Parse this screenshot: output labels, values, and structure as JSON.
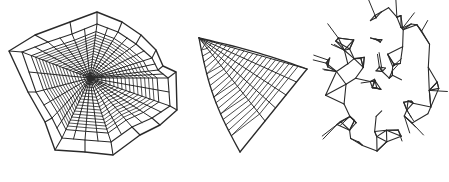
{
  "figure": {
    "alt": "Three spider web types: orb web, triangle web, and tangled cobweb",
    "width": 449,
    "height": 182,
    "background": "#ffffff",
    "stroke_color": "#2a2a2a"
  },
  "webs": [
    {
      "name": "orb-web",
      "label": "Orb web",
      "hub": [
        90,
        78
      ],
      "frame": [
        [
          9,
          51
        ],
        [
          35,
          35
        ],
        [
          70,
          22
        ],
        [
          97,
          12
        ],
        [
          122,
          22
        ],
        [
          141,
          35
        ],
        [
          156,
          50
        ],
        [
          163,
          66
        ],
        [
          176,
          72
        ],
        [
          177,
          110
        ],
        [
          160,
          125
        ],
        [
          140,
          135
        ],
        [
          113,
          155
        ],
        [
          85,
          152
        ],
        [
          55,
          150
        ],
        [
          45,
          122
        ],
        [
          28,
          92
        ]
      ],
      "inner_frame": [
        [
          22,
          52
        ],
        [
          48,
          42
        ],
        [
          72,
          34
        ],
        [
          97,
          24
        ],
        [
          118,
          32
        ],
        [
          136,
          44
        ],
        [
          152,
          58
        ],
        [
          158,
          70
        ],
        [
          168,
          78
        ],
        [
          170,
          106
        ],
        [
          152,
          118
        ],
        [
          132,
          127
        ],
        [
          111,
          142
        ],
        [
          85,
          140
        ],
        [
          62,
          138
        ],
        [
          52,
          118
        ],
        [
          36,
          92
        ]
      ],
      "spiral_turns": 16,
      "spiral_r_min": 4,
      "spiral_r_max": 52
    },
    {
      "name": "triangle-web",
      "label": "Triangle web",
      "apex": [
        199,
        38
      ],
      "right": [
        307,
        69
      ],
      "bottom": [
        240,
        152
      ],
      "radials": 4,
      "rungs": 22
    },
    {
      "name": "cobweb",
      "label": "Tangled cobweb",
      "bounds": [
        322,
        4,
        442,
        156
      ],
      "nodes": 90,
      "seed": 7
    }
  ]
}
